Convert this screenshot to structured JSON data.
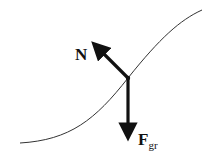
{
  "diagram": {
    "labels": {
      "normal_force": "N",
      "gravity_force_main": "F",
      "gravity_force_sub": "gr"
    },
    "colors": {
      "curve": "#333333",
      "arrow": "#111111",
      "background": "#ffffff"
    }
  }
}
